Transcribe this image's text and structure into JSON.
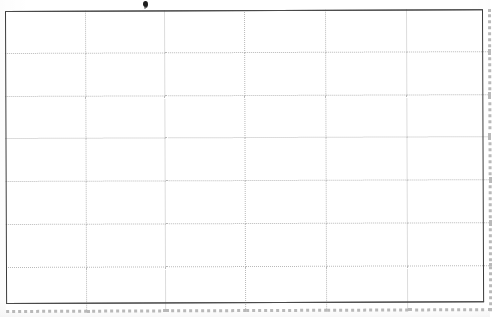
{
  "document": {
    "kind": "scanned-blank-table",
    "description": "Scanned blank ruled table grid",
    "page_background": "#ffffff",
    "paper_tint": "#fbfbfb"
  },
  "table": {
    "name": "blank-grid-table",
    "columns": 6,
    "rows": 7,
    "has_header_row": false,
    "all_cells_empty": true,
    "outer_border_color": "#3a3a3a",
    "inner_line_color": "#b9b9b9",
    "inner_line_style": "dotted",
    "bounds": {
      "left": 5,
      "top": 11,
      "right": 483,
      "bottom": 304
    },
    "column_x_positions": [
      5,
      85,
      163,
      242,
      322,
      402,
      483
    ],
    "row_y_positions": [
      11,
      53,
      95,
      136,
      178,
      220,
      262,
      304
    ],
    "column_headers": [
      "",
      "",
      "",
      "",
      "",
      ""
    ],
    "cells": [
      [
        "",
        "",
        "",
        "",
        "",
        ""
      ],
      [
        "",
        "",
        "",
        "",
        "",
        ""
      ],
      [
        "",
        "",
        "",
        "",
        "",
        ""
      ],
      [
        "",
        "",
        "",
        "",
        "",
        ""
      ],
      [
        "",
        "",
        "",
        "",
        "",
        ""
      ],
      [
        "",
        "",
        "",
        "",
        "",
        ""
      ],
      [
        "",
        "",
        "",
        "",
        "",
        ""
      ]
    ]
  },
  "artifacts": {
    "ink_blot": {
      "name": "ink-blot",
      "x": 145,
      "y": 3,
      "color": "#1d1d1d",
      "label": ""
    }
  }
}
